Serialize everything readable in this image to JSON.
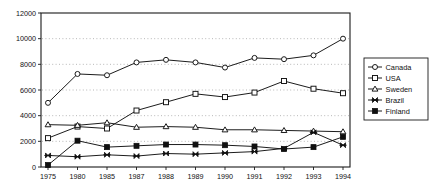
{
  "chart_data": {
    "type": "line",
    "title": "",
    "subtitle": "",
    "xlabel": "",
    "ylabel": "",
    "grid": true,
    "legend_position": "right-outside",
    "categories": [
      "1975",
      "1980",
      "1985",
      "1987",
      "1988",
      "1989",
      "1990",
      "1991",
      "1992",
      "1993",
      "1994"
    ],
    "x": [
      1975,
      1980,
      1985,
      1987,
      1988,
      1989,
      1990,
      1991,
      1992,
      1993,
      1994
    ],
    "ylim": [
      0,
      12000
    ],
    "yticks": [
      0,
      2000,
      4000,
      6000,
      8000,
      10000,
      12000
    ],
    "ytick_labels": [
      "0",
      "2000",
      "4000",
      "6000",
      "8000",
      "10000",
      "12000"
    ],
    "series": [
      {
        "name": "Canada",
        "marker": "open-circle",
        "values": [
          5000,
          7250,
          7150,
          8150,
          8350,
          8150,
          7750,
          8500,
          8400,
          8700,
          10000
        ]
      },
      {
        "name": "USA",
        "marker": "open-square",
        "values": [
          2250,
          3150,
          3000,
          4400,
          5050,
          5700,
          5450,
          5800,
          6700,
          6100,
          5750
        ]
      },
      {
        "name": "Sweden",
        "marker": "open-triangle",
        "values": [
          3300,
          3250,
          3450,
          3100,
          3150,
          3100,
          2900,
          2900,
          2850,
          2800,
          2750
        ]
      },
      {
        "name": "Brazil",
        "marker": "bowtie",
        "values": [
          900,
          800,
          950,
          850,
          1050,
          1000,
          1100,
          1200,
          1450,
          2700,
          1700
        ]
      },
      {
        "name": "Finland",
        "marker": "solid-square",
        "values": [
          150,
          2050,
          1550,
          1650,
          1750,
          1750,
          1700,
          1600,
          1400,
          1550,
          2350
        ]
      }
    ]
  },
  "legend": {
    "entries": [
      {
        "label": "Canada",
        "marker": "open-circle"
      },
      {
        "label": "USA",
        "marker": "open-square"
      },
      {
        "label": "Sweden",
        "marker": "open-triangle"
      },
      {
        "label": "Brazil",
        "marker": "bowtie"
      },
      {
        "label": "Finland",
        "marker": "solid-square"
      }
    ]
  },
  "colors": {
    "line": "#101010",
    "axis": "#1a1a1a",
    "grid": "#9a9a9a",
    "background": "#ffffff",
    "marker_fill": "#ffffff"
  }
}
